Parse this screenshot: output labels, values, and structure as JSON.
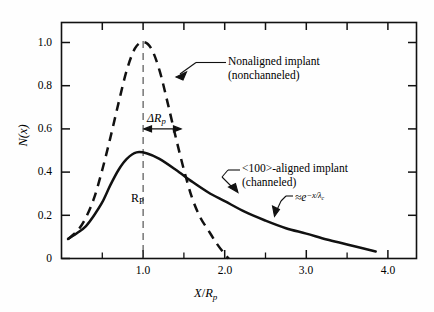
{
  "chart_data": {
    "type": "line",
    "title": "",
    "xlabel": "X/Rp",
    "ylabel": "N(x)",
    "xlim": [
      0,
      4.35
    ],
    "ylim": [
      0,
      1.09
    ],
    "grid": false,
    "legend_position": "inline-annotations",
    "x_ticks_major": [
      "1.0",
      "2.0",
      "3.0",
      "4.0"
    ],
    "x_ticks_major_values": [
      1.0,
      2.0,
      3.0,
      4.0
    ],
    "x_ticks_minor_values": [
      0.5,
      1.5,
      2.5,
      3.5
    ],
    "y_ticks_major": [
      "0",
      "0.2",
      "0.4",
      "0.6",
      "0.8",
      "1.0"
    ],
    "y_ticks_major_values": [
      0,
      0.2,
      0.4,
      0.6,
      0.8,
      1.0
    ],
    "series": [
      {
        "name": "Nonaligned implant (nonchanneled)",
        "style": "dashed",
        "peak_x": 1.0,
        "peak_y": 1.0,
        "x": [
          0.08,
          0.2,
          0.3,
          0.4,
          0.5,
          0.6,
          0.7,
          0.8,
          0.9,
          1.0,
          1.1,
          1.2,
          1.3,
          1.4,
          1.5,
          1.6,
          1.7,
          1.8,
          1.9,
          2.0,
          2.05
        ],
        "values": [
          0.09,
          0.13,
          0.19,
          0.28,
          0.41,
          0.56,
          0.72,
          0.87,
          0.97,
          1.0,
          0.97,
          0.87,
          0.72,
          0.56,
          0.41,
          0.28,
          0.19,
          0.13,
          0.07,
          0.02,
          0.0
        ]
      },
      {
        "name": "<100>-aligned implant (channeled)",
        "style": "solid",
        "peak_x": 0.92,
        "peak_y": 0.49,
        "x": [
          0.08,
          0.2,
          0.3,
          0.4,
          0.5,
          0.6,
          0.7,
          0.8,
          0.92,
          1.05,
          1.2,
          1.4,
          1.6,
          1.8,
          2.0,
          2.25,
          2.5,
          2.75,
          3.0,
          3.25,
          3.5,
          3.85
        ],
        "values": [
          0.09,
          0.12,
          0.15,
          0.2,
          0.26,
          0.34,
          0.41,
          0.46,
          0.49,
          0.485,
          0.46,
          0.41,
          0.355,
          0.305,
          0.265,
          0.215,
          0.175,
          0.14,
          0.115,
          0.088,
          0.065,
          0.032
        ]
      }
    ],
    "annotations": [
      {
        "id": "nonaligned",
        "line1": "Nonaligned implant",
        "line2": "(nonchanneled)",
        "points_to": "dashed curve right flank"
      },
      {
        "id": "aligned",
        "line1": "<100>-aligned implant",
        "line2": "(channeled)",
        "points_to": "solid curve right flank"
      },
      {
        "id": "exponential-tail",
        "text": "≈e",
        "exponent": "−x/λ",
        "exponent_sub": "c",
        "points_to": "solid curve tail"
      },
      {
        "id": "delta-rp",
        "text": "ΔR",
        "sub": "p",
        "type": "span-arrow",
        "from_x": 1.0,
        "to_x": 1.45,
        "at_y": 0.6
      },
      {
        "id": "rp",
        "text": "R",
        "sub": "P",
        "type": "vertical-line-label",
        "at_x": 1.0
      }
    ]
  },
  "axes": {
    "y_title": "N(x)",
    "x_title_num": "X",
    "x_title_den": "R",
    "x_title_den_sub": "p"
  }
}
